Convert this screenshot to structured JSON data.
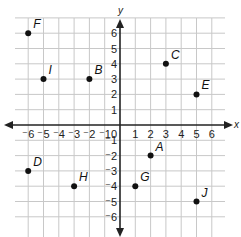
{
  "chart_data": {
    "type": "scatter",
    "title": "",
    "xlabel": "x",
    "ylabel": "y",
    "xlim": [
      -6,
      6
    ],
    "ylim": [
      -6,
      6
    ],
    "grid": true,
    "x_ticks": [
      "-6",
      "-5",
      "-4",
      "-3",
      "-2",
      "-1",
      "0",
      "1",
      "2",
      "3",
      "4",
      "5",
      "6"
    ],
    "y_ticks": [
      "6",
      "5",
      "4",
      "3",
      "2",
      "1",
      "-1",
      "-2",
      "-3",
      "-4",
      "-5",
      "-6"
    ],
    "points": [
      {
        "label": "F",
        "x": -6,
        "y": 6
      },
      {
        "label": "I",
        "x": -5,
        "y": 3
      },
      {
        "label": "B",
        "x": -2,
        "y": 3
      },
      {
        "label": "C",
        "x": 3,
        "y": 4
      },
      {
        "label": "E",
        "x": 5,
        "y": 2
      },
      {
        "label": "D",
        "x": -6,
        "y": -3
      },
      {
        "label": "H",
        "x": -3,
        "y": -4
      },
      {
        "label": "A",
        "x": 2,
        "y": -2
      },
      {
        "label": "G",
        "x": 1,
        "y": -4
      },
      {
        "label": "J",
        "x": 5,
        "y": -5
      }
    ]
  },
  "colors": {
    "grid": "#c8c8c8",
    "axis": "#222222",
    "point": "#111111"
  }
}
